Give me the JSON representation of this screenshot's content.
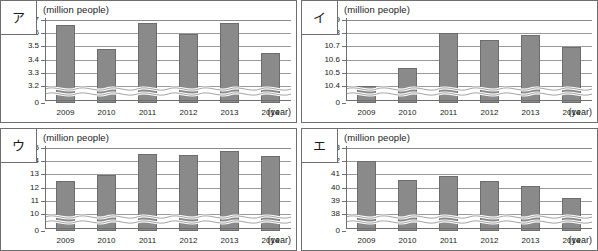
{
  "figure": {
    "unit_label": "(million people)",
    "x_axis_label": "(year)",
    "years": [
      "2009",
      "2010",
      "2011",
      "2012",
      "2013",
      "2014"
    ]
  },
  "panels": [
    {
      "key": "a",
      "label": "ア",
      "chart_data": {
        "type": "bar",
        "title": "ア",
        "xlabel": "(year)",
        "ylabel": "(million people)",
        "categories": [
          "2009",
          "2010",
          "2011",
          "2012",
          "2013",
          "2014"
        ],
        "values": [
          3.665,
          3.48,
          3.68,
          3.595,
          3.675,
          3.45
        ],
        "yticks": [
          "3.7",
          "3.6",
          "3.5",
          "3.4",
          "3.3",
          "3.2",
          "0"
        ],
        "ytick_values": [
          3.7,
          3.6,
          3.5,
          3.4,
          3.3,
          3.2,
          0
        ],
        "ylim": [
          3.2,
          3.7
        ],
        "axis_break": true,
        "grid": true,
        "legend": "none"
      }
    },
    {
      "key": "i",
      "label": "イ",
      "chart_data": {
        "type": "bar",
        "title": "イ",
        "xlabel": "(year)",
        "ylabel": "(million people)",
        "categories": [
          "2009",
          "2010",
          "2011",
          "2012",
          "2013",
          "2014"
        ],
        "values": [
          10.4,
          10.535,
          10.8,
          10.745,
          10.785,
          10.695
        ],
        "yticks": [
          "10.9",
          "10.8",
          "10.7",
          "10.6",
          "10.5",
          "10.4",
          "0"
        ],
        "ytick_values": [
          10.9,
          10.8,
          10.7,
          10.6,
          10.5,
          10.4,
          0
        ],
        "ylim": [
          10.4,
          10.9
        ],
        "axis_break": true,
        "grid": true,
        "legend": "none"
      }
    },
    {
      "key": "u",
      "label": "ウ",
      "chart_data": {
        "type": "bar",
        "title": "ウ",
        "xlabel": "(year)",
        "ylabel": "(million people)",
        "categories": [
          "2009",
          "2010",
          "2011",
          "2012",
          "2013",
          "2014"
        ],
        "values": [
          12.53,
          12.97,
          14.55,
          14.45,
          14.78,
          14.4
        ],
        "yticks": [
          "15",
          "14",
          "13",
          "12",
          "11",
          "10",
          "0"
        ],
        "ytick_values": [
          15,
          14,
          13,
          12,
          11,
          10,
          0
        ],
        "ylim": [
          10,
          15
        ],
        "axis_break": true,
        "grid": true,
        "legend": "none"
      }
    },
    {
      "key": "e",
      "label": "エ",
      "chart_data": {
        "type": "bar",
        "title": "エ",
        "xlabel": "(year)",
        "ylabel": "(million people)",
        "categories": [
          "2009",
          "2010",
          "2011",
          "2012",
          "2013",
          "2014"
        ],
        "values": [
          42.0,
          40.55,
          40.9,
          40.5,
          40.1,
          39.2
        ],
        "yticks": [
          "43",
          "42",
          "41",
          "40",
          "39",
          "38",
          "0"
        ],
        "ytick_values": [
          43,
          42,
          41,
          40,
          39,
          38,
          0
        ],
        "ylim": [
          38,
          43
        ],
        "axis_break": true,
        "grid": true,
        "legend": "none"
      }
    }
  ],
  "colors": {
    "bar_fill": "#8a8a8a",
    "bar_stroke": "#6d6d6d",
    "grid": "#9a9a9a",
    "axis": "#6f6f6f",
    "text": "#1a1a1a",
    "background": "#ffffff"
  }
}
